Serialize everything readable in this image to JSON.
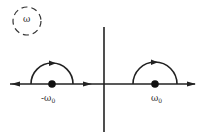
{
  "diagram": {
    "type": "contour-integration-plane",
    "plane_label": "ω",
    "poles": [
      {
        "label_prefix": "-ω",
        "label_sub": "0",
        "x": 52
      },
      {
        "label_prefix": "ω",
        "label_sub": "0",
        "x": 155
      }
    ],
    "contour_description": "Real axis with semicircular indentations above poles at -ω0 and ω0, arrows pointing right along axis",
    "colors": {
      "stroke": "#222222",
      "background": "#ffffff"
    }
  }
}
